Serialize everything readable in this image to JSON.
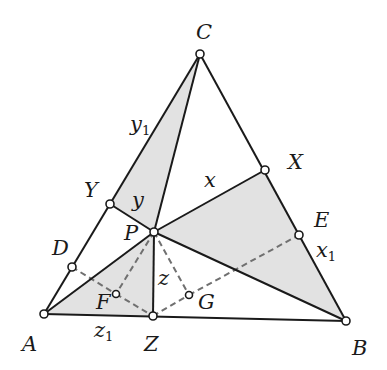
{
  "diagram": {
    "type": "geometry-triangle",
    "colors": {
      "line": "#1a1a1a",
      "dashed": "#707070",
      "shade": "#e2e2e2",
      "point_fill": "#ffffff"
    },
    "points": {
      "C": {
        "x": 200,
        "y": 54
      },
      "A": {
        "x": 44,
        "y": 314
      },
      "B": {
        "x": 346,
        "y": 321
      },
      "P": {
        "x": 154,
        "y": 232
      },
      "Z": {
        "x": 153,
        "y": 316
      },
      "X": {
        "x": 265,
        "y": 170
      },
      "Y": {
        "x": 110,
        "y": 204
      },
      "D": {
        "x": 72,
        "y": 267
      },
      "E": {
        "x": 299,
        "y": 235
      },
      "F": {
        "x": 116,
        "y": 294
      },
      "G": {
        "x": 189,
        "y": 295
      }
    },
    "labels": {
      "C": "C",
      "A": "A",
      "B": "B",
      "X": "X",
      "Y": "Y",
      "Z": "Z",
      "P": "P",
      "D": "D",
      "E": "E",
      "F": "F",
      "G": "G",
      "x": "x",
      "y": "y",
      "z": "z",
      "x1": "x",
      "x1_sub": "1",
      "y1": "y",
      "y1_sub": "1",
      "z1": "z",
      "z1_sub": "1"
    },
    "shaded_triangles": [
      [
        "C",
        "Y",
        "P"
      ],
      [
        "A",
        "P",
        "Z"
      ],
      [
        "P",
        "X",
        "B"
      ]
    ],
    "solid_segments": [
      [
        "A",
        "B"
      ],
      [
        "B",
        "C"
      ],
      [
        "C",
        "A"
      ],
      [
        "C",
        "P"
      ],
      [
        "P",
        "Z"
      ],
      [
        "P",
        "X"
      ],
      [
        "P",
        "Y"
      ],
      [
        "A",
        "P"
      ],
      [
        "P",
        "B"
      ]
    ],
    "dashed_segments": [
      [
        "D",
        "F"
      ],
      [
        "F",
        "Z"
      ],
      [
        "Z",
        "G"
      ],
      [
        "G",
        "E"
      ],
      [
        "P",
        "F"
      ],
      [
        "P",
        "G"
      ]
    ]
  }
}
